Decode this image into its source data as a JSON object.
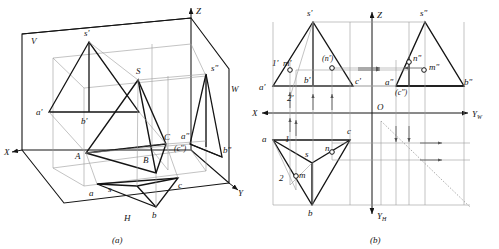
{
  "figure": {
    "subcaptions": {
      "a": "(a)",
      "b": "(b)"
    },
    "stroke_color": "#141414",
    "thin_color": "#888888",
    "dash_color": "#444444"
  },
  "panel_a": {
    "name": "axonometric-projection-box",
    "planes": [
      {
        "id": "V",
        "label": "V"
      },
      {
        "id": "H",
        "label": "H"
      },
      {
        "id": "W",
        "label": "W"
      }
    ],
    "axes": [
      {
        "id": "X",
        "label": "X"
      },
      {
        "id": "Y",
        "label": "Y"
      },
      {
        "id": "Z",
        "label": "Z"
      }
    ],
    "space_points": [
      {
        "label": "S"
      },
      {
        "label": "A"
      },
      {
        "label": "B"
      },
      {
        "label": "C"
      }
    ],
    "front_projections": [
      {
        "label": "s'"
      },
      {
        "label": "a'"
      },
      {
        "label": "b'"
      }
    ],
    "top_projections": [
      {
        "label": "s"
      },
      {
        "label": "a"
      },
      {
        "label": "b"
      },
      {
        "label": "c"
      }
    ],
    "side_projections": [
      {
        "label": "s\""
      },
      {
        "label": "a\""
      },
      {
        "label": "b\""
      },
      {
        "label": "(c\")"
      }
    ]
  },
  "panel_b": {
    "name": "three-view-projection",
    "axes": [
      {
        "id": "X",
        "label": "X"
      },
      {
        "id": "Z",
        "label": "Z"
      },
      {
        "id": "YW",
        "label": "Y",
        "sub": "W"
      },
      {
        "id": "YH",
        "label": "Y",
        "sub": "H"
      },
      {
        "id": "O",
        "label": "O"
      }
    ],
    "front_view_points": [
      {
        "label": "s'"
      },
      {
        "label": "a'"
      },
      {
        "label": "b'"
      },
      {
        "label": "c'"
      },
      {
        "label": "m'"
      },
      {
        "label": "(n')"
      },
      {
        "label": "1'"
      },
      {
        "label": "2'"
      }
    ],
    "top_view_points": [
      {
        "label": "s"
      },
      {
        "label": "a"
      },
      {
        "label": "b"
      },
      {
        "label": "c"
      },
      {
        "label": "m"
      },
      {
        "label": "n"
      },
      {
        "label": "1"
      },
      {
        "label": "2"
      }
    ],
    "side_view_points": [
      {
        "label": "s\""
      },
      {
        "label": "a\""
      },
      {
        "label": "b\""
      },
      {
        "label": "(c\")"
      },
      {
        "label": "m\""
      },
      {
        "label": "n\""
      }
    ]
  }
}
